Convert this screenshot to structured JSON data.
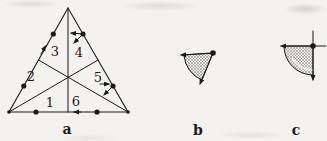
{
  "figure": {
    "background": "#f3f2ee",
    "ink": "#1b1b1b",
    "hatch_color": "#7d7d78"
  },
  "figure_a": {
    "label": "a",
    "region_labels": [
      "1",
      "2",
      "3",
      "4",
      "5",
      "6"
    ]
  },
  "figure_b": {
    "label": "b"
  },
  "figure_c": {
    "label": "c"
  }
}
